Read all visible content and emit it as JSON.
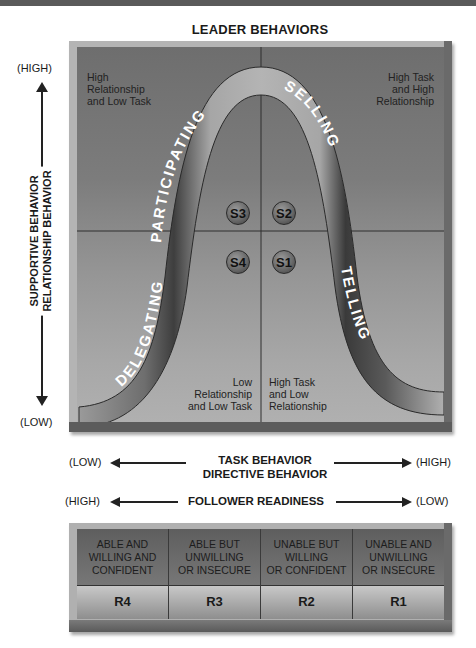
{
  "title": "LEADER BEHAVIORS",
  "y_axis": {
    "high": "(HIGH)",
    "low": "(LOW)",
    "label_line1": "SUPPORTIVE BEHAVIOR",
    "label_line2": "RELATIONSHIP BEHAVIOR"
  },
  "quadrants": {
    "top_left": [
      "High",
      "Relationship",
      "and Low Task"
    ],
    "top_right": [
      "High Task",
      "and High",
      "Relationship"
    ],
    "bottom_left": [
      "Low",
      "Relationship",
      "and Low Task"
    ],
    "bottom_right": [
      "High Task",
      "and Low",
      "Relationship"
    ]
  },
  "curve_labels": {
    "delegating": "DELEGATING",
    "participating": "PARTICIPATING",
    "selling": "SELLING",
    "telling": "TELLING"
  },
  "styles": [
    {
      "id": "S3",
      "label": "S3"
    },
    {
      "id": "S2",
      "label": "S2"
    },
    {
      "id": "S4",
      "label": "S4"
    },
    {
      "id": "S1",
      "label": "S1"
    }
  ],
  "x_axis": {
    "left": "(LOW)",
    "right": "(HIGH)",
    "label_line1": "TASK BEHAVIOR",
    "label_line2": "DIRECTIVE BEHAVIOR"
  },
  "readiness_axis": {
    "left": "(HIGH)",
    "right": "(LOW)",
    "label": "FOLLOWER READINESS"
  },
  "readiness_levels": [
    {
      "description": [
        "ABLE AND",
        "WILLING AND",
        "CONFIDENT"
      ],
      "code": "R4"
    },
    {
      "description": [
        "ABLE BUT",
        "UNWILLING",
        "OR INSECURE"
      ],
      "code": "R3"
    },
    {
      "description": [
        "UNABLE BUT",
        "WILLING",
        "OR CONFIDENT"
      ],
      "code": "R2"
    },
    {
      "description": [
        "UNABLE AND",
        "UNWILLING",
        "OR INSECURE"
      ],
      "code": "R1"
    }
  ],
  "colors": {
    "panel_dark": "#6e6e6e",
    "panel_light": "#b0b0b0",
    "curve_light": "#b8b8b8",
    "curve_dark": "#3a3a3a",
    "text": "#1a1a1a"
  }
}
